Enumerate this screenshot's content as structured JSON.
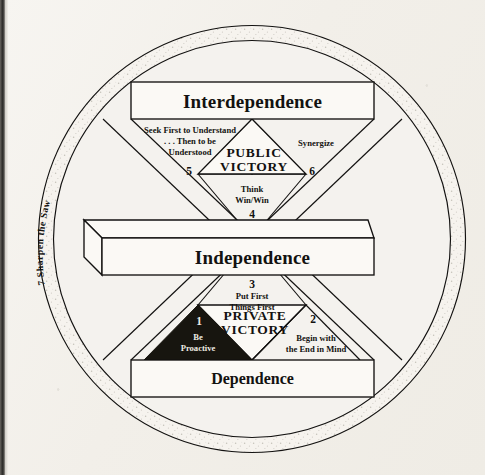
{
  "figure": {
    "levels": {
      "top": "Interdependence",
      "middle": "Independence",
      "bottom": "Dependence"
    },
    "sections": {
      "public_victory": "PUBLIC\nVICTORY",
      "public_victory_line1": "PUBLIC",
      "public_victory_line2": "VICTORY",
      "private_victory_line1": "PRIVATE",
      "private_victory_line2": "VICTORY"
    },
    "habits": [
      {
        "number": "1",
        "label_lines": [
          "Be",
          "Proactive"
        ],
        "label": "Be Proactive",
        "filled": true,
        "group": "private-victory"
      },
      {
        "number": "2",
        "label_lines": [
          "Begin with",
          "the End in Mind"
        ],
        "label": "Begin with the End in Mind",
        "filled": false,
        "group": "private-victory"
      },
      {
        "number": "3",
        "label_lines": [
          "Put First",
          "Things First"
        ],
        "label": "Put First Things First",
        "filled": false,
        "group": "private-victory"
      },
      {
        "number": "4",
        "label_lines": [
          "Think",
          "Win/Win"
        ],
        "label": "Think Win/Win",
        "filled": false,
        "group": "public-victory"
      },
      {
        "number": "5",
        "label_lines": [
          "Seek First to Understand",
          ". . . Then to be",
          "Understood"
        ],
        "label": "Seek First to Understand . . . Then to be Understood",
        "filled": false,
        "group": "public-victory"
      },
      {
        "number": "6",
        "label_lines": [
          "Synergize"
        ],
        "label": "Synergize",
        "filled": false,
        "group": "public-victory"
      },
      {
        "number": "7",
        "label_lines": [
          "Sharpen the Saw"
        ],
        "label": "Sharpen the Saw",
        "filled": false,
        "group": "renewal-ring"
      }
    ],
    "ring_label": "7  Sharpen the Saw",
    "colors": {
      "ink": "#121110",
      "paper": "#f4f2ee",
      "box_fill": "#fbf9f5",
      "filled_habit": "#17150f",
      "filled_habit_text": "#efece4"
    }
  }
}
